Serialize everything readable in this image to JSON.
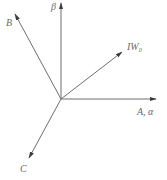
{
  "diagram": {
    "title": "",
    "type": "phasor/vector diagram",
    "origin": {
      "x": 61,
      "y": 99
    },
    "colors": {
      "line": "#6e6e6e",
      "arrowhead": "#3a3a3a",
      "text": "#6a6a6a",
      "background": "#ffffff"
    },
    "vectors": [
      {
        "id": "beta",
        "label": "β",
        "tip": {
          "x": 61,
          "y": 3
        },
        "label_pos": {
          "x": 51,
          "y": 10
        }
      },
      {
        "id": "B",
        "label": "B",
        "tip": {
          "x": 15,
          "y": 14
        },
        "label_pos": {
          "x": 6,
          "y": 26
        }
      },
      {
        "id": "IW0",
        "label_main": "IW",
        "label_sub": "0",
        "tip": {
          "x": 122,
          "y": 52
        },
        "label_pos": {
          "x": 127,
          "y": 50
        }
      },
      {
        "id": "A",
        "label": "A, α",
        "tip": {
          "x": 156,
          "y": 99
        },
        "label_pos": {
          "x": 137,
          "y": 115
        }
      },
      {
        "id": "C",
        "label": "C",
        "tip": {
          "x": 29,
          "y": 158
        },
        "label_pos": {
          "x": 20,
          "y": 172
        }
      }
    ]
  }
}
